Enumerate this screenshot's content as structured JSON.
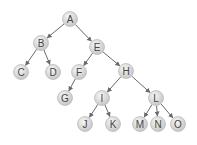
{
  "diagram": {
    "type": "tree",
    "nodes": [
      {
        "id": "A",
        "label": "A",
        "x": 70,
        "y": 19
      },
      {
        "id": "B",
        "label": "B",
        "x": 41,
        "y": 43
      },
      {
        "id": "E",
        "label": "E",
        "x": 97,
        "y": 47
      },
      {
        "id": "C",
        "label": "C",
        "x": 21,
        "y": 72
      },
      {
        "id": "D",
        "label": "D",
        "x": 53,
        "y": 72
      },
      {
        "id": "F",
        "label": "F",
        "x": 79,
        "y": 72
      },
      {
        "id": "H",
        "label": "H",
        "x": 126,
        "y": 71
      },
      {
        "id": "G",
        "label": "G",
        "x": 65,
        "y": 98
      },
      {
        "id": "I",
        "label": "I",
        "x": 102,
        "y": 98
      },
      {
        "id": "L",
        "label": "L",
        "x": 156,
        "y": 98
      },
      {
        "id": "J",
        "label": "J",
        "x": 85,
        "y": 124
      },
      {
        "id": "K",
        "label": "K",
        "x": 113,
        "y": 124
      },
      {
        "id": "M",
        "label": "M",
        "x": 140,
        "y": 124
      },
      {
        "id": "N",
        "label": "N",
        "x": 158,
        "y": 124
      },
      {
        "id": "O",
        "label": "O",
        "x": 178,
        "y": 124
      }
    ],
    "edges": [
      [
        "A",
        "B"
      ],
      [
        "A",
        "E"
      ],
      [
        "B",
        "C"
      ],
      [
        "B",
        "D"
      ],
      [
        "E",
        "F"
      ],
      [
        "E",
        "H"
      ],
      [
        "F",
        "G"
      ],
      [
        "H",
        "I"
      ],
      [
        "H",
        "L"
      ],
      [
        "I",
        "J"
      ],
      [
        "I",
        "K"
      ],
      [
        "L",
        "M"
      ],
      [
        "L",
        "N"
      ],
      [
        "L",
        "O"
      ]
    ],
    "colors": {
      "node_fill_light": "#f2f2f2",
      "node_fill_dark": "#c8c8c8",
      "node_stroke": "#bdbdbd",
      "edge": "#6a6a6a",
      "label": "#444444"
    }
  }
}
